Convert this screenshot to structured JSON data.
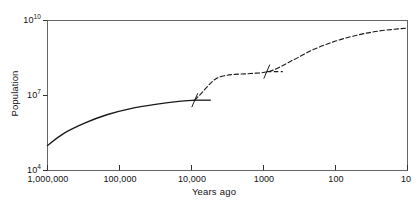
{
  "chart_data": {
    "type": "line",
    "title": "",
    "xlabel": "Years ago",
    "ylabel": "Population",
    "xscale": "log-reversed",
    "yscale": "log",
    "xlim": [
      1000000,
      10
    ],
    "ylim": [
      10000,
      10000000000
    ],
    "grid": false,
    "legend": false,
    "x_ticks": [
      "1,000,000",
      "100,000",
      "10,000",
      "1000",
      "100",
      "10"
    ],
    "x_tick_values": [
      1000000,
      100000,
      10000,
      1000,
      100,
      10
    ],
    "y_ticks": [
      "10^4",
      "10^7",
      "10^10"
    ],
    "y_tick_values": [
      10000,
      10000000,
      10000000000
    ],
    "series": [
      {
        "name": "Hunter-gatherer era",
        "style": "solid",
        "color": "#1a1a1a",
        "points": [
          {
            "x": 1000000,
            "y": 100000
          },
          {
            "x": 600000,
            "y": 300000
          },
          {
            "x": 300000,
            "y": 800000
          },
          {
            "x": 150000,
            "y": 1700000
          },
          {
            "x": 70000,
            "y": 3000000
          },
          {
            "x": 30000,
            "y": 4500000
          },
          {
            "x": 15000,
            "y": 5800000
          },
          {
            "x": 9000,
            "y": 6500000
          }
        ]
      },
      {
        "name": "Agricultural and industrial era",
        "style": "dashed",
        "color": "#1a1a1a",
        "points": [
          {
            "x": 9000,
            "y": 6500000
          },
          {
            "x": 7000,
            "y": 14000000
          },
          {
            "x": 5500,
            "y": 30000000
          },
          {
            "x": 4500,
            "y": 48000000
          },
          {
            "x": 3500,
            "y": 62000000
          },
          {
            "x": 2500,
            "y": 70000000
          },
          {
            "x": 1500,
            "y": 76000000
          },
          {
            "x": 800,
            "y": 95000000
          },
          {
            "x": 400,
            "y": 250000000
          },
          {
            "x": 200,
            "y": 700000000
          },
          {
            "x": 100,
            "y": 1500000000
          },
          {
            "x": 50,
            "y": 2600000000
          },
          {
            "x": 25,
            "y": 3800000000
          },
          {
            "x": 10,
            "y": 5000000000
          }
        ]
      }
    ],
    "annotations": [
      {
        "name": "break-mark-agricultural",
        "x": 9000,
        "y": 6500000,
        "label": ""
      },
      {
        "name": "break-mark-industrial",
        "x": 900,
        "y": 90000000,
        "label": ""
      }
    ]
  },
  "axes": {
    "y_tick_0": "10",
    "y_tick_0_exp": "4",
    "y_tick_1": "10",
    "y_tick_1_exp": "7",
    "y_tick_2": "10",
    "y_tick_2_exp": "10",
    "x_tick_0": "1,000,000",
    "x_tick_1": "100,000",
    "x_tick_2": "10,000",
    "x_tick_3": "1000",
    "x_tick_4": "100",
    "x_tick_5": "10",
    "ylabel": "Population",
    "xlabel": "Years ago"
  },
  "colors": {
    "line": "#1a1a1a",
    "frame": "#555555",
    "background": "#ffffff"
  }
}
